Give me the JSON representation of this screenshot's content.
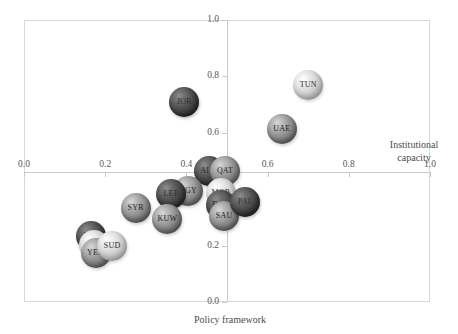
{
  "chart_data": {
    "type": "scatter",
    "title": "",
    "xlabel": "Policy framework",
    "ylabel": "Institutional capacity",
    "xlim": [
      0.0,
      1.0
    ],
    "ylim": [
      0.0,
      1.0
    ],
    "xticks": [
      "0.0",
      "0.2",
      "0.4",
      "0.6",
      "0.8",
      "1.0"
    ],
    "xtick_values": [
      0.0,
      0.2,
      0.4,
      0.6,
      0.8,
      1.0
    ],
    "yticks": [
      "0.0",
      "0.2",
      "0.4",
      "0.6",
      "0.8",
      "1.0"
    ],
    "ytick_values": [
      0.0,
      0.2,
      0.4,
      0.6,
      0.8,
      1.0
    ],
    "grid": false,
    "legend": "none",
    "axis_cross_x": 0.5,
    "axis_cross_y": 0.46,
    "points": [
      {
        "label": "TUN",
        "x": 0.7,
        "y": 0.77,
        "shade": "light",
        "size": 30
      },
      {
        "label": "UAE",
        "x": 0.635,
        "y": 0.615,
        "shade": "mid",
        "size": 30
      },
      {
        "label": "JOR",
        "x": 0.395,
        "y": 0.71,
        "shade": "dark",
        "size": 30
      },
      {
        "label": "ALG",
        "x": 0.455,
        "y": 0.465,
        "shade": "dark",
        "size": 30
      },
      {
        "label": "QAT",
        "x": 0.495,
        "y": 0.465,
        "shade": "mid",
        "size": 30
      },
      {
        "label": "MOR",
        "x": 0.485,
        "y": 0.385,
        "shade": "light",
        "size": 30
      },
      {
        "label": "BAH",
        "x": 0.485,
        "y": 0.345,
        "shade": "dark",
        "size": 30
      },
      {
        "label": "SAU",
        "x": 0.493,
        "y": 0.305,
        "shade": "mid",
        "size": 30
      },
      {
        "label": "PAL",
        "x": 0.545,
        "y": 0.355,
        "shade": "dark",
        "size": 30
      },
      {
        "label": "EGY",
        "x": 0.405,
        "y": 0.395,
        "shade": "mid",
        "size": 30
      },
      {
        "label": "LEB",
        "x": 0.363,
        "y": 0.383,
        "shade": "dark",
        "size": 30
      },
      {
        "label": "KUW",
        "x": 0.353,
        "y": 0.295,
        "shade": "mid",
        "size": 30
      },
      {
        "label": "SYR",
        "x": 0.275,
        "y": 0.335,
        "shade": "mid",
        "size": 30
      },
      {
        "label": "IRQ",
        "x": 0.165,
        "y": 0.235,
        "shade": "dark",
        "size": 30
      },
      {
        "label": "LIB",
        "x": 0.172,
        "y": 0.203,
        "shade": "light",
        "size": 30
      },
      {
        "label": "YEM",
        "x": 0.178,
        "y": 0.173,
        "shade": "mid",
        "size": 30
      },
      {
        "label": "SUD",
        "x": 0.217,
        "y": 0.198,
        "shade": "light",
        "size": 30
      }
    ]
  }
}
